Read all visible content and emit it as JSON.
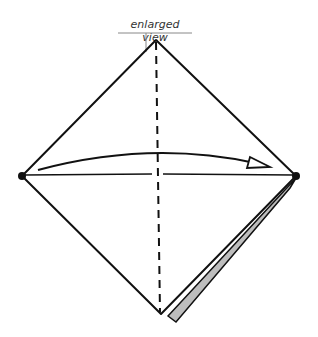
{
  "diagram": {
    "label": "enlarged view",
    "colors": {
      "stroke": "#111111",
      "flap_fill": "#bdbdbd",
      "label_line": "#888888"
    },
    "elements": [
      "diamond-outline",
      "vertical-valley-fold-line",
      "horizontal-crease",
      "curved-fold-arrow",
      "left-reference-dot",
      "right-reference-dot",
      "gray-flap-edge"
    ]
  }
}
